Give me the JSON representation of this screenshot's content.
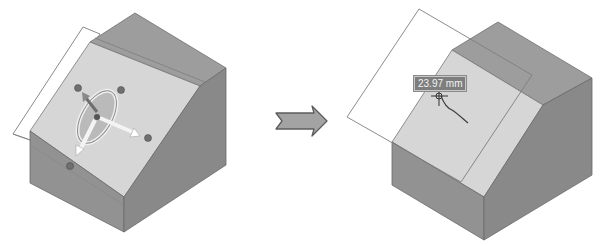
{
  "figure": {
    "before_view": {
      "label": "before",
      "gizmo": "move-rotate-triad"
    },
    "transition_arrow": {
      "icon": "right-arrow-icon"
    },
    "after_view": {
      "label": "after",
      "dimension_value": "23.97 mm"
    },
    "colors": {
      "top_face": "#9a9a9a",
      "sloped_face": "#d4d4d4",
      "front_face": "#8e8e8e",
      "right_face": "#858585",
      "plane_outline": "#7a7a7a",
      "arrow_fill": "#a0a0a0"
    }
  }
}
